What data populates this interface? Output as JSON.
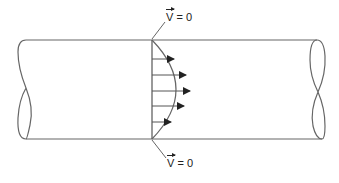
{
  "diagram": {
    "type": "pipe flow velocity profile",
    "top_label": {
      "symbol": "V",
      "equals": "= 0"
    },
    "bottom_label": {
      "symbol": "V",
      "equals": "= 0"
    },
    "arrows_count": 6,
    "colors": {
      "stroke": "#555555",
      "arrow": "#222222",
      "text": "#222222"
    }
  }
}
